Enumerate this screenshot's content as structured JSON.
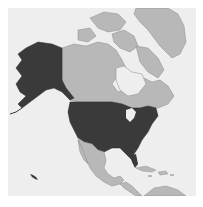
{
  "map": {
    "region": "North America",
    "highlighted_country": "United States",
    "colors": {
      "background": "#ffffff",
      "ocean": "#eeeeee",
      "highlighted": "#3a3a3a",
      "other_land": "#b8b8b8",
      "border": "#8a8a8a"
    }
  }
}
